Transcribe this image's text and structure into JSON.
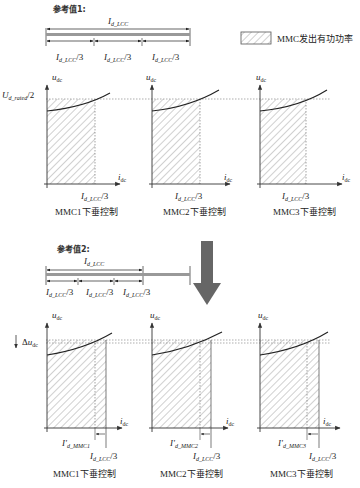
{
  "legend": {
    "swatch": "hatched-rectangle",
    "label": "MMC发出有功功率"
  },
  "ref1": {
    "title": "参考值1:",
    "total_label": "I_d_LCC",
    "segments": [
      "I_d_LCC/3",
      "I_d_LCC/3",
      "I_d_LCC/3"
    ]
  },
  "ref2": {
    "title": "参考值2:",
    "total_label": "I_d_LCC",
    "segments": [
      "I_d_LCC/3",
      "I_d_LCC/3",
      "I_d_LCC/3"
    ]
  },
  "axes": {
    "y": "u_dc",
    "x": "i_dc"
  },
  "top_row": {
    "y_level_label": "U_d_rated/2",
    "panels": [
      {
        "caption": "MMC1下垂控制",
        "x_mark": "I_d_LCC/3"
      },
      {
        "caption": "MMC2下垂控制",
        "x_mark": "I_d_LCC/3"
      },
      {
        "caption": "MMC3下垂控制",
        "x_mark": "I_d_LCC/3"
      }
    ]
  },
  "transition_arrow": {
    "direction": "down",
    "color": "#666666"
  },
  "bottom_row": {
    "delta_label": "Δu_dc",
    "panels": [
      {
        "caption": "MMC1下垂控制",
        "x_mark": "I_d_LCC/3",
        "new_mark": "I'_d_MMC1"
      },
      {
        "caption": "MMC2下垂控制",
        "x_mark": "I_d_LCC/3",
        "new_mark": "I'_d_MMC2"
      },
      {
        "caption": "MMC3下垂控制",
        "x_mark": "I_d_LCC/3",
        "new_mark": "I'_d_MMC3"
      }
    ]
  },
  "colors": {
    "line": "#333333",
    "hatch": "#888888",
    "bar": "#999999",
    "arrow": "#666666"
  }
}
